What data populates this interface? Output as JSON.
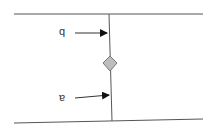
{
  "diagram": {
    "labels": {
      "top": "q",
      "bottom": "ɐ"
    },
    "colors": {
      "line": "#555555",
      "arrow": "#111111",
      "diamond_fill": "#bdbdbd",
      "diamond_stroke": "#777777",
      "background": "#ffffff"
    },
    "elements": [
      {
        "type": "line",
        "name": "top-boundary",
        "from": [
          14,
          14
        ],
        "to": [
          203,
          14
        ]
      },
      {
        "type": "line",
        "name": "bottom-boundary",
        "from": [
          14,
          123
        ],
        "to": [
          203,
          119
        ]
      },
      {
        "type": "line",
        "name": "vertical-connector",
        "from": [
          109,
          14
        ],
        "to": [
          112,
          121
        ]
      },
      {
        "type": "arrow",
        "name": "arrow-q",
        "from": [
          75,
          33
        ],
        "to": [
          107,
          33
        ]
      },
      {
        "type": "arrow",
        "name": "arrow-a",
        "from": [
          75,
          98
        ],
        "to": [
          109,
          95
        ]
      },
      {
        "type": "diamond",
        "name": "junction-diamond",
        "center": [
          110,
          63
        ],
        "size": 14
      }
    ]
  }
}
